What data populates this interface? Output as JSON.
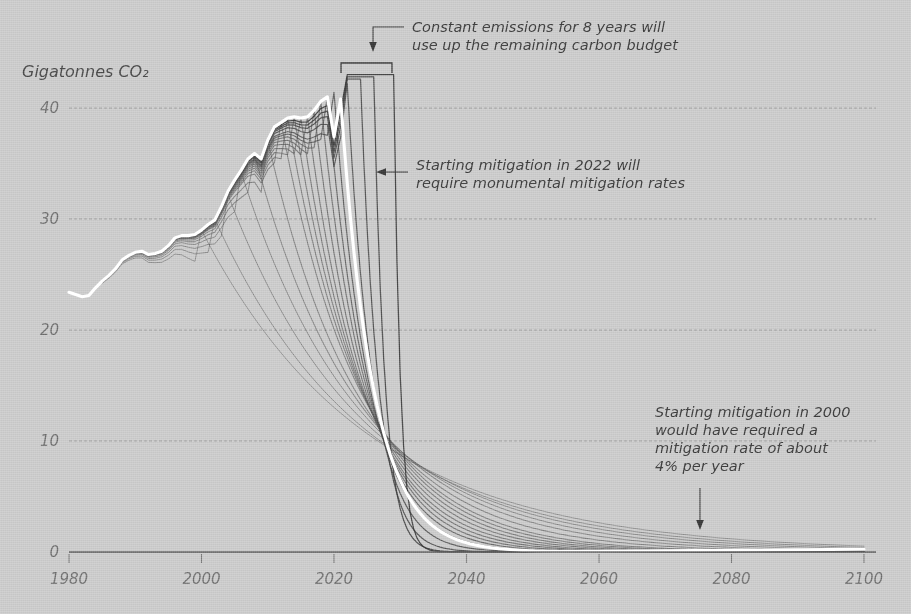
{
  "figure": {
    "background_color": "#c9c9c9",
    "historical_line_color": "#ffffff",
    "scenario_line_color": "#4f4f4f",
    "grid_color": "#8f8f8f",
    "text_color": "#3d3d3d"
  },
  "axes": {
    "y_axis_title": "Gigatonnes CO₂",
    "y_ticks": [
      "0",
      "10",
      "20",
      "30",
      "40"
    ],
    "x_ticks": [
      "1980",
      "2000",
      "2020",
      "2040",
      "2060",
      "2080",
      "2100"
    ]
  },
  "annotations": {
    "constant_emissions": {
      "line1": "Constant emissions for 8 years will",
      "line2": "use up the remaining carbon budget"
    },
    "mitigation_2022": {
      "line1": "Starting mitigation in 2022 will",
      "line2": "require monumental mitigation rates"
    },
    "mitigation_2000": {
      "line1": "Starting mitigation in 2000",
      "line2": "would have required a",
      "line3": "mitigation rate of about",
      "line4": "4% per year"
    }
  },
  "chart_data": {
    "type": "line",
    "title": "",
    "subtitle": "",
    "xlabel": "",
    "ylabel": "Gigatonnes CO₂",
    "xlim": [
      1980,
      2100
    ],
    "ylim": [
      0,
      44
    ],
    "grid": true,
    "legend": "none",
    "x_ticks": [
      1980,
      2000,
      2020,
      2040,
      2060,
      2080,
      2100
    ],
    "y_ticks": [
      0,
      10,
      20,
      30,
      40
    ],
    "budget_crossing": {
      "year": 2029,
      "value": 17.0,
      "note": "all mitigation pathways cross here; area under each curve is equal (remaining carbon budget)"
    },
    "series": [
      {
        "name": "Historical emissions",
        "color": "#ffffff",
        "type": "historical",
        "x": [
          1980,
          1981,
          1982,
          1983,
          1984,
          1985,
          1986,
          1987,
          1988,
          1989,
          1990,
          1991,
          1992,
          1993,
          1994,
          1995,
          1996,
          1997,
          1998,
          1999,
          2000,
          2001,
          2002,
          2003,
          2004,
          2005,
          2006,
          2007,
          2008,
          2009,
          2010,
          2011,
          2012,
          2013,
          2014,
          2015,
          2016,
          2017,
          2018,
          2019,
          2020,
          2021
        ],
        "y": [
          23.4,
          23.2,
          23.0,
          23.1,
          23.8,
          24.4,
          24.9,
          25.5,
          26.3,
          26.7,
          27.0,
          27.1,
          26.8,
          26.9,
          27.1,
          27.6,
          28.3,
          28.5,
          28.5,
          28.6,
          29.0,
          29.5,
          29.9,
          31.1,
          32.5,
          33.5,
          34.4,
          35.4,
          35.9,
          35.4,
          37.1,
          38.3,
          38.7,
          39.1,
          39.2,
          39.1,
          39.2,
          39.8,
          40.6,
          41.0,
          37.4,
          40.8
        ]
      },
      {
        "name": "Mitigation starting 2000 (~4% per year)",
        "color": "#5a5a5a",
        "type": "scenario",
        "peak_year": 2000,
        "mitigation_rate_percent": 4,
        "peak_value": 29.0
      },
      {
        "name": "Mitigation starting 2002",
        "color": "#5a5a5a",
        "type": "scenario",
        "peak_year": 2002,
        "mitigation_rate_percent": 4.4,
        "peak_value": 30.0
      },
      {
        "name": "Mitigation starting 2004",
        "color": "#5a5a5a",
        "type": "scenario",
        "peak_year": 2004,
        "mitigation_rate_percent": 4.9,
        "peak_value": 32.2
      },
      {
        "name": "Mitigation starting 2006",
        "color": "#5a5a5a",
        "type": "scenario",
        "peak_year": 2006,
        "mitigation_rate_percent": 5.5,
        "peak_value": 34.2
      },
      {
        "name": "Mitigation starting 2008",
        "color": "#5a5a5a",
        "type": "scenario",
        "peak_year": 2008,
        "mitigation_rate_percent": 6.2,
        "peak_value": 35.8
      },
      {
        "name": "Mitigation starting 2010",
        "color": "#5a5a5a",
        "type": "scenario",
        "peak_year": 2010,
        "mitigation_rate_percent": 7.1,
        "peak_value": 37.1
      },
      {
        "name": "Mitigation starting 2012",
        "color": "#5a5a5a",
        "type": "scenario",
        "peak_year": 2012,
        "mitigation_rate_percent": 8.2,
        "peak_value": 38.7
      },
      {
        "name": "Mitigation starting 2013",
        "color": "#5a5a5a",
        "type": "scenario",
        "peak_year": 2013,
        "mitigation_rate_percent": 8.9,
        "peak_value": 39.1
      },
      {
        "name": "Mitigation starting 2014",
        "color": "#5a5a5a",
        "type": "scenario",
        "peak_year": 2014,
        "mitigation_rate_percent": 9.7,
        "peak_value": 39.2
      },
      {
        "name": "Mitigation starting 2015",
        "color": "#5a5a5a",
        "type": "scenario",
        "peak_year": 2015,
        "mitigation_rate_percent": 10.6,
        "peak_value": 39.1
      },
      {
        "name": "Mitigation starting 2016",
        "color": "#5a5a5a",
        "type": "scenario",
        "peak_year": 2016,
        "mitigation_rate_percent": 11.7,
        "peak_value": 39.2
      },
      {
        "name": "Mitigation starting 2017",
        "color": "#5a5a5a",
        "type": "scenario",
        "peak_year": 2017,
        "mitigation_rate_percent": 13.0,
        "peak_value": 39.8
      },
      {
        "name": "Mitigation starting 2018",
        "color": "#5a5a5a",
        "type": "scenario",
        "peak_year": 2018,
        "mitigation_rate_percent": 14.6,
        "peak_value": 40.6
      },
      {
        "name": "Mitigation starting 2019",
        "color": "#4e4e4e",
        "type": "scenario",
        "peak_year": 2019,
        "mitigation_rate_percent": 16.5,
        "peak_value": 41.0
      },
      {
        "name": "Mitigation starting 2020",
        "color": "#4a4a4a",
        "type": "scenario",
        "peak_year": 2020,
        "mitigation_rate_percent": 19.0,
        "peak_value": 41.4
      },
      {
        "name": "Mitigation starting 2022",
        "color": "#464646",
        "type": "scenario",
        "peak_year": 2022,
        "mitigation_rate_percent": 26.0,
        "peak_value": 42.2
      },
      {
        "name": "Mitigation starting 2024",
        "color": "#424242",
        "type": "scenario",
        "peak_year": 2024,
        "mitigation_rate_percent": 38.0,
        "peak_value": 42.6
      },
      {
        "name": "Mitigation starting 2026",
        "color": "#3d3d3d",
        "type": "scenario",
        "peak_year": 2026,
        "mitigation_rate_percent": 60.0,
        "peak_value": 42.8
      },
      {
        "name": "Mitigation starting 2029 (budget exhausted)",
        "color": "#343434",
        "type": "scenario",
        "peak_year": 2029,
        "mitigation_rate_percent": 100.0,
        "peak_value": 43.0
      }
    ]
  }
}
